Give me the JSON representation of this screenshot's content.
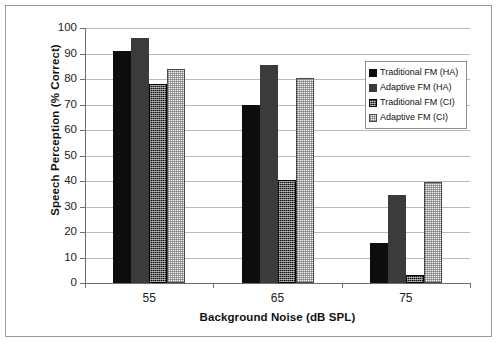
{
  "chart_data": {
    "type": "bar",
    "title": "",
    "xlabel": "Background  Noise (dB SPL)",
    "ylabel": "Speech Perception (% Correct)",
    "categories": [
      "55",
      "65",
      "75"
    ],
    "ylim": [
      0,
      100
    ],
    "yticks": [
      0,
      10,
      20,
      30,
      40,
      50,
      60,
      70,
      80,
      90,
      100
    ],
    "grid": "horizontal",
    "legend_position": "upper-right-inside",
    "series": [
      {
        "name": "Traditional FM (HA)",
        "values": [
          91,
          70,
          15.5
        ],
        "fill": "solid-black",
        "color": "#0d0d0d"
      },
      {
        "name": "Adaptive FM (HA)",
        "values": [
          96,
          85.5,
          34.5
        ],
        "fill": "solid-dark-gray",
        "color": "#3b3b3b"
      },
      {
        "name": "Traditional FM (CI)",
        "values": [
          78,
          40.5,
          3
        ],
        "fill": "dark-crosshatch",
        "color": "#101010"
      },
      {
        "name": "Adaptive FM (CI)",
        "values": [
          84,
          80.5,
          39.8
        ],
        "fill": "light-stipple",
        "color": "#f2f2f2"
      }
    ]
  },
  "legend": {
    "items": [
      {
        "label": "Traditional FM (HA)"
      },
      {
        "label": "Adaptive FM (HA)"
      },
      {
        "label": "Traditional FM (CI)"
      },
      {
        "label": "Adaptive FM (CI)"
      }
    ]
  },
  "axes": {
    "y_tick_labels": [
      "100",
      "90",
      "80",
      "70",
      "60",
      "50",
      "40",
      "30",
      "20",
      "10",
      "0"
    ],
    "x_tick_labels": [
      "55",
      "65",
      "75"
    ]
  }
}
